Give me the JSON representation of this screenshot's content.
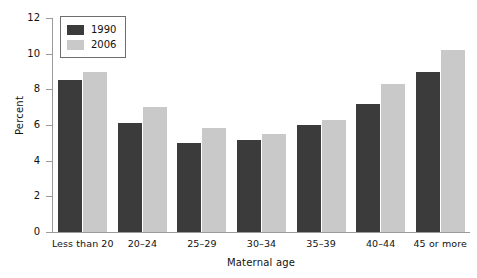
{
  "chart_data": {
    "type": "bar",
    "title": "",
    "xlabel": "Maternal age",
    "ylabel": "Percent",
    "ylim": [
      0,
      12
    ],
    "yticks": [
      0,
      2,
      4,
      6,
      8,
      10,
      12
    ],
    "grid": false,
    "legend_position": "top-left",
    "categories": [
      "Less than 20",
      "20–24",
      "25–29",
      "30–34",
      "35–39",
      "40–44",
      "45 or more"
    ],
    "series": [
      {
        "name": "1990",
        "color": "#3b3b3b",
        "values": [
          8.5,
          6.1,
          5.0,
          5.15,
          6.0,
          7.2,
          9.0
        ]
      },
      {
        "name": "2006",
        "color": "#c9c9c9",
        "values": [
          9.0,
          7.0,
          5.85,
          5.5,
          6.3,
          8.3,
          10.2
        ]
      }
    ]
  }
}
